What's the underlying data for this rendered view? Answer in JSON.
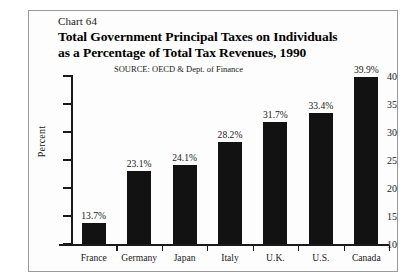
{
  "figure": {
    "chart_number": "Chart 64",
    "title_line_1": "Total Government Principal Taxes on Individuals",
    "title_line_2": "as a Percentage of Total Tax Revenues, 1990",
    "source": "SOURCE:  OECD & Dept. of Finance"
  },
  "chart_data": {
    "type": "bar",
    "title": "Total Government Principal Taxes on Individuals as a Percentage of Total Tax Revenues, 1990",
    "subtitle": "Chart 64",
    "annotations": [
      "SOURCE:  OECD & Dept. of Finance"
    ],
    "categories": [
      "France",
      "Germany",
      "Japan",
      "Italy",
      "U.K.",
      "U.S.",
      "Canada"
    ],
    "values": [
      13.7,
      23.1,
      24.1,
      28.2,
      31.7,
      33.4,
      39.9
    ],
    "data_labels": [
      "13.7%",
      "23.1%",
      "24.1%",
      "28.2%",
      "31.7%",
      "33.4%",
      "39.9%"
    ],
    "xlabel": "",
    "ylabel": "Percent",
    "ylim": [
      10,
      40
    ],
    "yticks": [
      10,
      15,
      20,
      25,
      30,
      35,
      40
    ],
    "ytick_labels": [
      "10",
      "15",
      "20",
      "25",
      "30",
      "35",
      "40"
    ],
    "grid": false,
    "legend": false,
    "bar_color": "#121212"
  }
}
